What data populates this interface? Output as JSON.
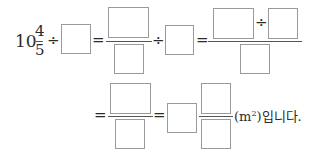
{
  "problem": {
    "row1": {
      "whole": "10",
      "frac_num": "4",
      "frac_den": "5",
      "div1": "÷",
      "eq1": "=",
      "div2": "÷",
      "eq2": "=",
      "div3": "÷"
    },
    "row2": {
      "eq1": "=",
      "eq2": "=",
      "unit_open": "(m",
      "unit_sup": "2",
      "unit_close": ")입니다."
    }
  },
  "colors": {
    "box_border": "#9a9a9a",
    "text": "#2a2a2a"
  }
}
